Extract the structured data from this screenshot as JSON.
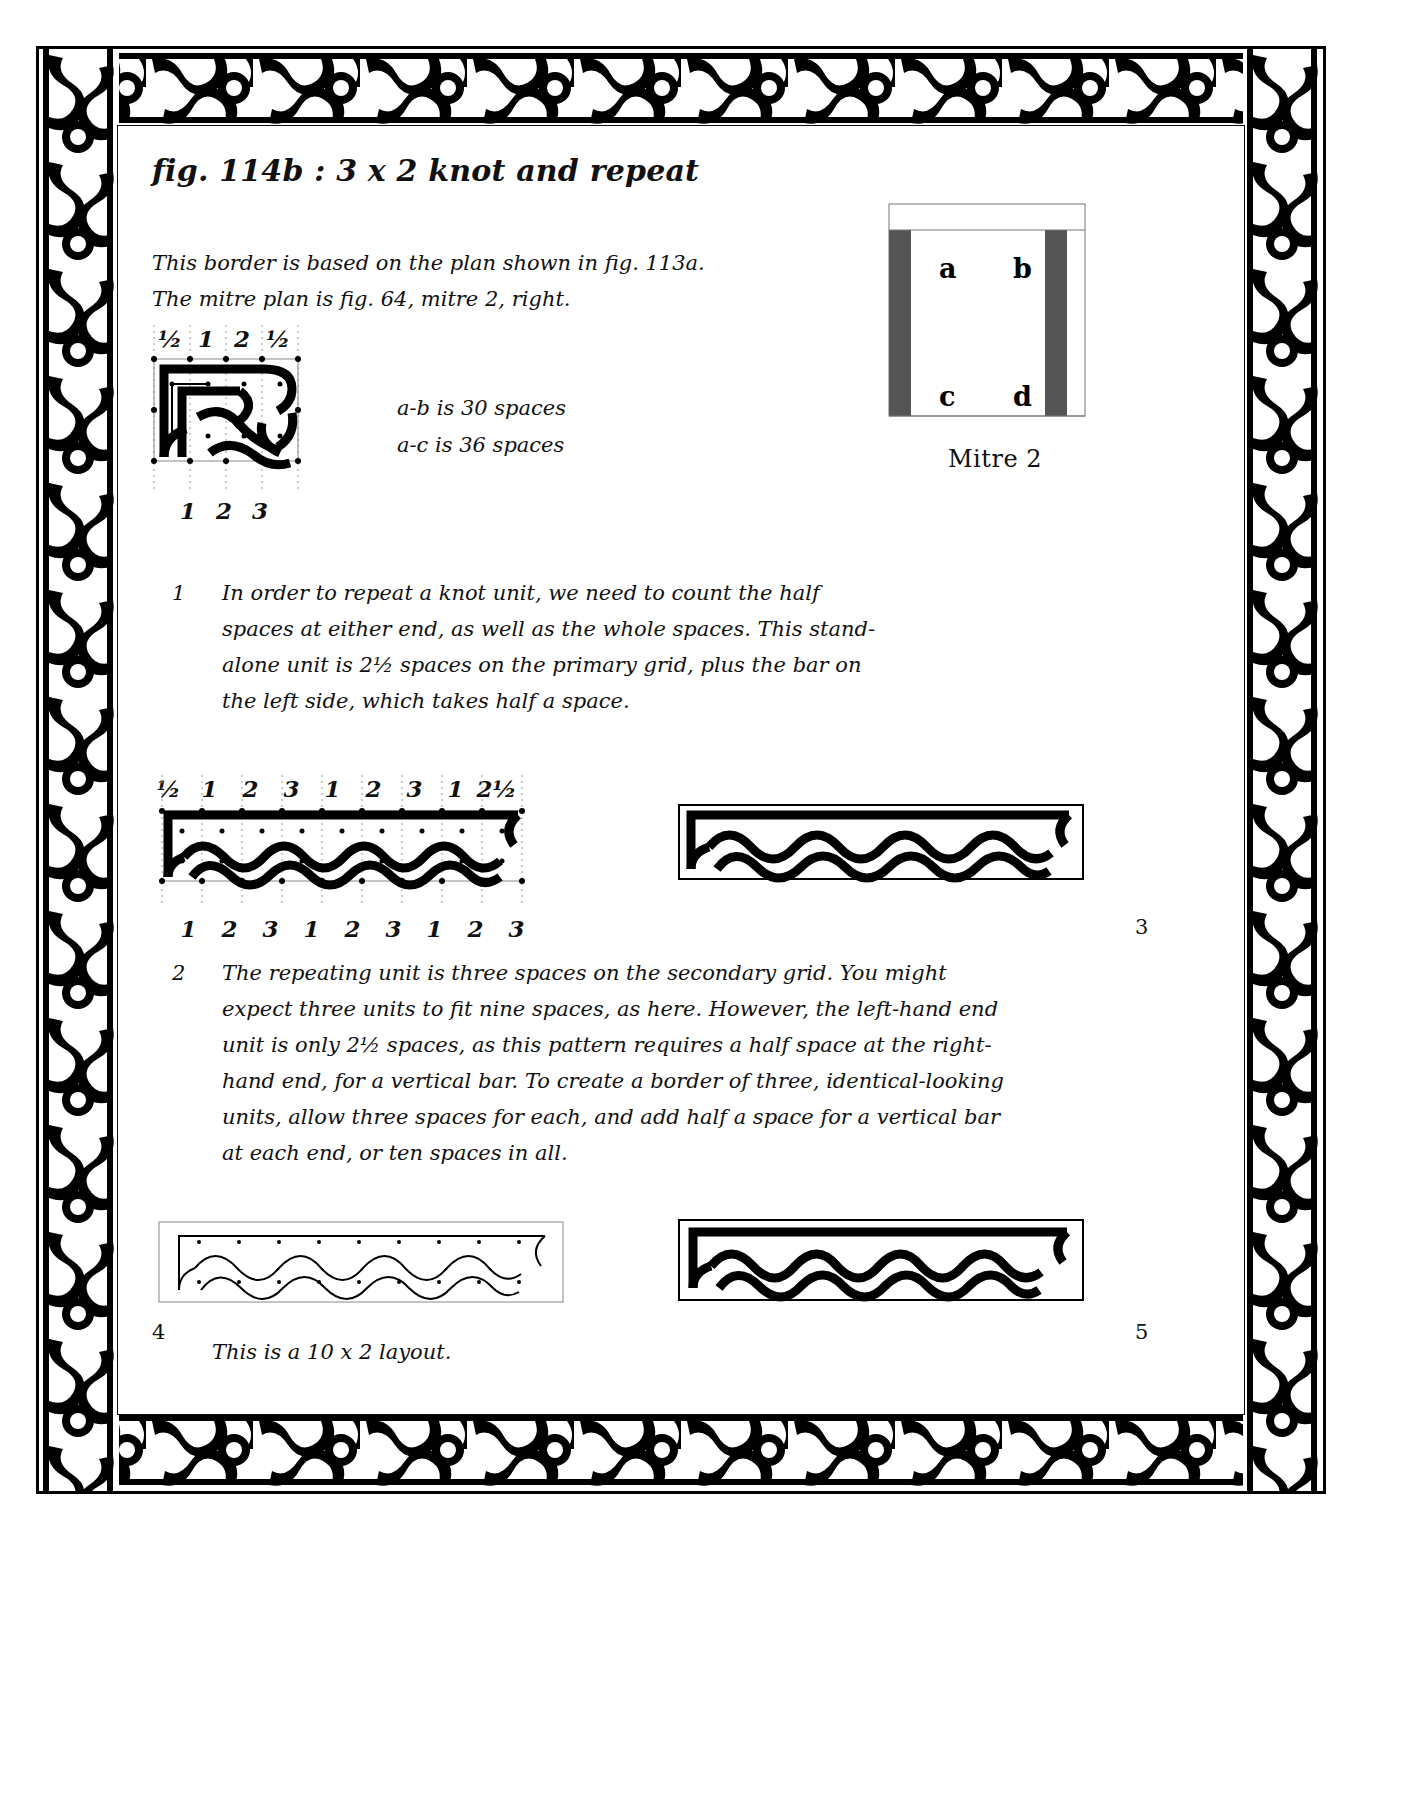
{
  "page": {
    "title": "fig. 114b : 3 x 2 knot and repeat",
    "intro_lines": [
      "This border is based on the plan shown in fig. 113a.",
      "The mitre plan is fig. 64, mitre 2, right."
    ]
  },
  "spaces_note": {
    "line1": "a-b is 30 spaces",
    "line2": "a-c is 36 spaces"
  },
  "mitre": {
    "caption": "Mitre 2",
    "corner_labels": {
      "a": "a",
      "b": "b",
      "c": "c",
      "d": "d"
    }
  },
  "unit_diagram": {
    "top_labels": [
      "½",
      "1",
      "2",
      "½"
    ],
    "bottom_labels": [
      "1",
      "2",
      "3"
    ]
  },
  "repeat_diagram": {
    "top_labels": [
      "½",
      "1",
      "2",
      "3",
      "1",
      "2",
      "3",
      "1",
      "2½"
    ],
    "bottom_labels": [
      "1",
      "2",
      "3",
      "1",
      "2",
      "3",
      "1",
      "2",
      "3"
    ]
  },
  "paragraphs": [
    {
      "number": "1",
      "text": "In order to repeat a knot unit, we need to count the half spaces at either end, as well as the whole spaces. This stand-alone unit is 2½ spaces on the primary grid, plus the bar on the left side, which takes half a space."
    },
    {
      "number": "2",
      "text": "The repeating unit is three spaces on the secondary grid. You might expect three units to fit nine spaces, as here. However, the left-hand end unit is only 2½ spaces, as this pattern requires a half space at the right-hand end, for a vertical bar. To create a border of three, identical-looking units, allow three spaces for each, and add half a space for a vertical bar at each end, or ten spaces in all."
    }
  ],
  "figure_numbers": {
    "fig3": "3",
    "fig4": "4",
    "fig5": "5"
  },
  "bottom_caption": "This is a 10 x 2 layout.",
  "colors": {
    "ink": "#000000",
    "grid": "#9a9a9a",
    "mitre_bar": "#555555",
    "paper": "#ffffff"
  }
}
